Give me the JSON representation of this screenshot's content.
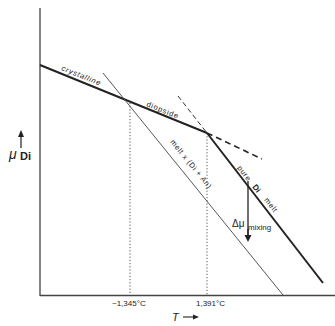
{
  "figure": {
    "y_axis_label": "μ",
    "y_axis_subscript": "Di",
    "x_axis_label": "T",
    "x_ticks": [
      "~1,345°C",
      "1,391°C"
    ],
    "curves": {
      "crystalline": "crystalline",
      "diopside": "diopside",
      "pure_prefix": "pure",
      "pure_di": "Di",
      "pure_suffix": "melt",
      "melt_mixture": "melt x (Di + An)"
    },
    "delta_label": "Δμ",
    "delta_subscript": "mixing"
  }
}
